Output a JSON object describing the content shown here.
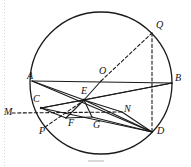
{
  "figure": {
    "type": "geometry-diagram",
    "width": 191,
    "height": 167,
    "stroke_color": "#1a1a1a",
    "background_color": "#ffffff",
    "circle": {
      "cx": 101,
      "cy": 83,
      "r": 71
    },
    "points": [
      {
        "id": "A",
        "label": "A",
        "x": 32,
        "y": 81,
        "label_x": 27,
        "label_y": 71
      },
      {
        "id": "B",
        "label": "B",
        "x": 172,
        "y": 83,
        "label_x": 175,
        "label_y": 73
      },
      {
        "id": "O",
        "label": "O",
        "x": 101,
        "y": 81,
        "label_x": 99,
        "label_y": 66
      },
      {
        "id": "Q",
        "label": "Q",
        "x": 152,
        "y": 33,
        "label_x": 156,
        "label_y": 20
      },
      {
        "id": "D",
        "label": "D",
        "x": 152,
        "y": 132,
        "label_x": 157,
        "label_y": 126
      },
      {
        "id": "C",
        "label": "C",
        "x": 41,
        "y": 108,
        "label_x": 33,
        "label_y": 94
      },
      {
        "id": "P",
        "label": "P",
        "x": 45,
        "y": 127,
        "label_x": 39,
        "label_y": 126
      },
      {
        "id": "E",
        "label": "E",
        "x": 84,
        "y": 100,
        "label_x": 81,
        "label_y": 86
      },
      {
        "id": "F",
        "label": "F",
        "x": 66,
        "y": 118,
        "label_x": 68,
        "label_y": 118
      },
      {
        "id": "G",
        "label": "G",
        "x": 92,
        "y": 117,
        "label_x": 93,
        "label_y": 120
      },
      {
        "id": "M",
        "label": "M",
        "x": 20,
        "y": 113,
        "label_x": 4,
        "label_y": 107
      },
      {
        "id": "N",
        "label": "N",
        "x": 122,
        "y": 112,
        "label_x": 124,
        "label_y": 104
      }
    ],
    "solid_segments": [
      [
        "A",
        "B"
      ],
      [
        "A",
        "E"
      ],
      [
        "A",
        "D"
      ],
      [
        "C",
        "E"
      ],
      [
        "C",
        "B"
      ],
      [
        "C",
        "D"
      ],
      [
        "E",
        "O"
      ],
      [
        "E",
        "B"
      ],
      [
        "E",
        "D"
      ],
      [
        "E",
        "F"
      ],
      [
        "E",
        "G"
      ],
      [
        "E",
        "N"
      ],
      [
        "F",
        "G"
      ],
      [
        "F",
        "D"
      ],
      [
        "G",
        "D"
      ],
      [
        "C",
        "F"
      ],
      [
        "N",
        "D"
      ],
      [
        "E",
        "C"
      ]
    ],
    "dashed_segments": [
      [
        "M",
        "N"
      ],
      [
        "O",
        "Q"
      ],
      [
        "Q",
        "D"
      ],
      [
        "P",
        "E"
      ],
      [
        "Q",
        "B"
      ]
    ],
    "labels": [
      "A",
      "B",
      "O",
      "Q",
      "D",
      "C",
      "P",
      "E",
      "F",
      "G",
      "M",
      "N"
    ]
  }
}
